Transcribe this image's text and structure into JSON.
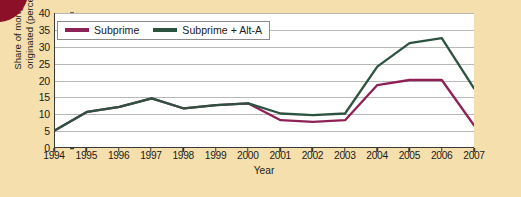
{
  "chart_data": {
    "type": "line",
    "title": "",
    "xlabel": "Year",
    "ylabel": "Share of mortgages originated (percent)",
    "x": [
      1994,
      1995,
      1996,
      1997,
      1998,
      1999,
      2000,
      2001,
      2002,
      2003,
      2004,
      2005,
      2006,
      2007
    ],
    "xticklabels": [
      "1994",
      "1995",
      "1996",
      "1997",
      "1998",
      "1999",
      "2000",
      "2001",
      "2002",
      "2003",
      "2004",
      "2005",
      "2006",
      "2007"
    ],
    "yticklabels": [
      "0",
      "5",
      "10",
      "15",
      "20",
      "25",
      "30",
      "35",
      "40"
    ],
    "yticks": [
      0,
      5,
      10,
      15,
      20,
      25,
      30,
      35,
      40
    ],
    "ylim": [
      0,
      40
    ],
    "xlim": [
      1994,
      2007
    ],
    "grid": "horizontal",
    "legend_position": "top-left",
    "series": [
      {
        "name": "Subprime",
        "color": "#8e2156",
        "values": [
          5.0,
          10.5,
          12.0,
          14.5,
          11.5,
          12.5,
          13.0,
          8.0,
          7.5,
          8.0,
          18.5,
          20.0,
          20.0,
          6.5
        ]
      },
      {
        "name": "Subprime + Alt-A",
        "color": "#2d5340",
        "values": [
          5.0,
          10.5,
          12.0,
          14.5,
          11.5,
          12.5,
          13.0,
          10.0,
          9.5,
          10.0,
          24.0,
          31.0,
          32.5,
          17.5
        ]
      }
    ]
  },
  "legend": {
    "entries": [
      {
        "label": "Subprime",
        "color": "#8e2156"
      },
      {
        "label": "Subprime + Alt-A",
        "color": "#2d5340"
      }
    ]
  },
  "axes": {
    "x_title": "Year",
    "y_title": "Share of mortgages originated (percent)"
  },
  "colors": {
    "background": "#f5e0ad",
    "plot_background": "#ffffff",
    "gridline": "#b8b8b8",
    "axis": "#3a3a3a",
    "corner_decoration": "#8c1028",
    "subprime": "#8e2156",
    "subprime_alt_a": "#2d5340"
  }
}
